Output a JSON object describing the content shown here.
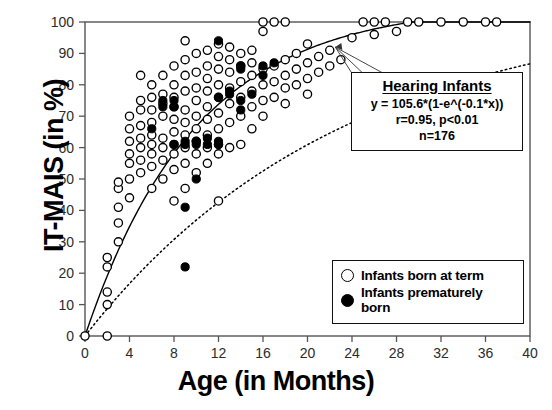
{
  "chart_data": {
    "type": "scatter",
    "title": "",
    "xlabel": "Age (in Months)",
    "ylabel": "IT-MAIS (in %)",
    "xlim": [
      0,
      40
    ],
    "ylim": [
      0,
      100
    ],
    "xticks": [
      0,
      4,
      8,
      12,
      16,
      20,
      24,
      28,
      32,
      36,
      40
    ],
    "yticks": [
      0,
      10,
      20,
      30,
      40,
      50,
      60,
      70,
      80,
      90,
      100
    ],
    "grid": false,
    "legend_position": "bottom-right",
    "series": [
      {
        "name": "Infants born at term",
        "marker": "open-circle",
        "color": "#000000",
        "points": [
          [
            0,
            0
          ],
          [
            2,
            0
          ],
          [
            2,
            10
          ],
          [
            2,
            14
          ],
          [
            2,
            22
          ],
          [
            2,
            25
          ],
          [
            3,
            30
          ],
          [
            3,
            36
          ],
          [
            3,
            41
          ],
          [
            3,
            47
          ],
          [
            3,
            49
          ],
          [
            4,
            44
          ],
          [
            4,
            50
          ],
          [
            4,
            55
          ],
          [
            4,
            58
          ],
          [
            4,
            62
          ],
          [
            4,
            66
          ],
          [
            4,
            70
          ],
          [
            5,
            52
          ],
          [
            5,
            56
          ],
          [
            5,
            60
          ],
          [
            5,
            63
          ],
          [
            5,
            67
          ],
          [
            5,
            72
          ],
          [
            5,
            75
          ],
          [
            5,
            83
          ],
          [
            6,
            47
          ],
          [
            6,
            54
          ],
          [
            6,
            58
          ],
          [
            6,
            61
          ],
          [
            6,
            64
          ],
          [
            6,
            68
          ],
          [
            6,
            72
          ],
          [
            6,
            76
          ],
          [
            6,
            80
          ],
          [
            7,
            50
          ],
          [
            7,
            56
          ],
          [
            7,
            60
          ],
          [
            7,
            63
          ],
          [
            7,
            70
          ],
          [
            7,
            74
          ],
          [
            7,
            77
          ],
          [
            7,
            83
          ],
          [
            8,
            43
          ],
          [
            8,
            53
          ],
          [
            8,
            58
          ],
          [
            8,
            61
          ],
          [
            8,
            65
          ],
          [
            8,
            69
          ],
          [
            8,
            73
          ],
          [
            8,
            76
          ],
          [
            8,
            80
          ],
          [
            8,
            86
          ],
          [
            9,
            47
          ],
          [
            9,
            55
          ],
          [
            9,
            60
          ],
          [
            9,
            64
          ],
          [
            9,
            68
          ],
          [
            9,
            72
          ],
          [
            9,
            78
          ],
          [
            9,
            83
          ],
          [
            9,
            88
          ],
          [
            9,
            94
          ],
          [
            10,
            52
          ],
          [
            10,
            58
          ],
          [
            10,
            62
          ],
          [
            10,
            66
          ],
          [
            10,
            70
          ],
          [
            10,
            75
          ],
          [
            10,
            79
          ],
          [
            10,
            84
          ],
          [
            10,
            90
          ],
          [
            11,
            55
          ],
          [
            11,
            60
          ],
          [
            11,
            64
          ],
          [
            11,
            69
          ],
          [
            11,
            73
          ],
          [
            11,
            78
          ],
          [
            11,
            82
          ],
          [
            11,
            86
          ],
          [
            11,
            91
          ],
          [
            12,
            43
          ],
          [
            12,
            58
          ],
          [
            12,
            61
          ],
          [
            12,
            66
          ],
          [
            12,
            71
          ],
          [
            12,
            76
          ],
          [
            12,
            80
          ],
          [
            12,
            85
          ],
          [
            12,
            89
          ],
          [
            12,
            93
          ],
          [
            13,
            60
          ],
          [
            13,
            68
          ],
          [
            13,
            74
          ],
          [
            13,
            79
          ],
          [
            13,
            84
          ],
          [
            13,
            88
          ],
          [
            13,
            92
          ],
          [
            14,
            61
          ],
          [
            14,
            70
          ],
          [
            14,
            76
          ],
          [
            14,
            81
          ],
          [
            14,
            86
          ],
          [
            14,
            90
          ],
          [
            15,
            66
          ],
          [
            15,
            73
          ],
          [
            15,
            78
          ],
          [
            15,
            83
          ],
          [
            15,
            87
          ],
          [
            15,
            91
          ],
          [
            16,
            70
          ],
          [
            16,
            75
          ],
          [
            16,
            80
          ],
          [
            16,
            85
          ],
          [
            16,
            97
          ],
          [
            16,
            100
          ],
          [
            17,
            76
          ],
          [
            17,
            81
          ],
          [
            17,
            86
          ],
          [
            17,
            100
          ],
          [
            18,
            74
          ],
          [
            18,
            79
          ],
          [
            18,
            83
          ],
          [
            18,
            88
          ],
          [
            18,
            100
          ],
          [
            19,
            80
          ],
          [
            19,
            85
          ],
          [
            19,
            90
          ],
          [
            20,
            77
          ],
          [
            20,
            82
          ],
          [
            20,
            87
          ],
          [
            20,
            93
          ],
          [
            21,
            84
          ],
          [
            21,
            89
          ],
          [
            22,
            86
          ],
          [
            22,
            91
          ],
          [
            23,
            88
          ],
          [
            24,
            95
          ],
          [
            25,
            100
          ],
          [
            26,
            96
          ],
          [
            26,
            100
          ],
          [
            27,
            100
          ],
          [
            28,
            97
          ],
          [
            29,
            100
          ],
          [
            30,
            100
          ],
          [
            32,
            100
          ],
          [
            34,
            100
          ],
          [
            36,
            100
          ],
          [
            37,
            100
          ]
        ]
      },
      {
        "name": "Infants prematurely born",
        "marker": "filled-circle",
        "color": "#000000",
        "points": [
          [
            6,
            66
          ],
          [
            7,
            73
          ],
          [
            7,
            75
          ],
          [
            8,
            61
          ],
          [
            8,
            73
          ],
          [
            8,
            75
          ],
          [
            9,
            61
          ],
          [
            9,
            62
          ],
          [
            9,
            41
          ],
          [
            9,
            22
          ],
          [
            10,
            50
          ],
          [
            10,
            61
          ],
          [
            10,
            62
          ],
          [
            11,
            61
          ],
          [
            11,
            63
          ],
          [
            12,
            61
          ],
          [
            12,
            62
          ],
          [
            12,
            76
          ],
          [
            12,
            94
          ],
          [
            13,
            77
          ],
          [
            13,
            78
          ],
          [
            14,
            72
          ],
          [
            14,
            75
          ],
          [
            14,
            85
          ],
          [
            14,
            86
          ],
          [
            15,
            77
          ],
          [
            16,
            83
          ],
          [
            16,
            86
          ],
          [
            17,
            87
          ]
        ]
      }
    ],
    "fit_curves": [
      {
        "name": "hearing-infants-fit",
        "style": "solid",
        "equation": "y = 105.6*(1-e^(-0.1*x))",
        "a": 105.6,
        "b": 0.1
      },
      {
        "name": "lower-reference-fit",
        "style": "dotted",
        "a": 105.6,
        "b": 0.043
      }
    ],
    "annotations": [
      {
        "name": "hearing-infants-box",
        "title": "Hearing Infants",
        "equation": "y = 105.6*(1-e^(-0.1*x))",
        "stats": "r=0.95, p<0.01",
        "n": "n=176",
        "arrow_to": [
          22.5,
          92
        ]
      }
    ]
  },
  "legend": {
    "items": [
      {
        "marker": "open-circle",
        "label": "Infants born at term"
      },
      {
        "marker": "filled-circle",
        "label": "Infants prematurely born"
      }
    ]
  }
}
